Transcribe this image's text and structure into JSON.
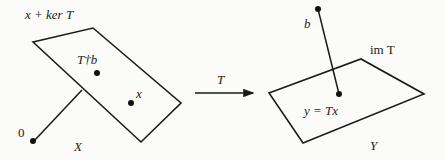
{
  "diagram": {
    "left": {
      "plane_label": "x + ker T",
      "space_label": "X",
      "origin_label": "0",
      "points": [
        {
          "label": "T†b",
          "name": "pseudoinverse-solution"
        },
        {
          "label": "x",
          "name": "solution-x"
        }
      ]
    },
    "map": {
      "label": "T"
    },
    "right": {
      "plane_label": "im T",
      "space_label": "Y",
      "points": [
        {
          "label": "b",
          "name": "target-b"
        },
        {
          "label": "y = Tx",
          "name": "image-point"
        }
      ]
    }
  }
}
